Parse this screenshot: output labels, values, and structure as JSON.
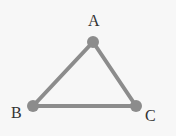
{
  "diagram": {
    "type": "triangle",
    "vertices": [
      {
        "label": "A",
        "x": 93,
        "y": 42
      },
      {
        "label": "B",
        "x": 33,
        "y": 106
      },
      {
        "label": "C",
        "x": 136,
        "y": 106
      }
    ],
    "edges": [
      [
        "A",
        "B"
      ],
      [
        "B",
        "C"
      ],
      [
        "C",
        "A"
      ]
    ],
    "colors": {
      "edge": "#8c8c8c",
      "vertex": "#8c8c8c",
      "label": "#333333",
      "background": "#f7f7f7"
    }
  }
}
